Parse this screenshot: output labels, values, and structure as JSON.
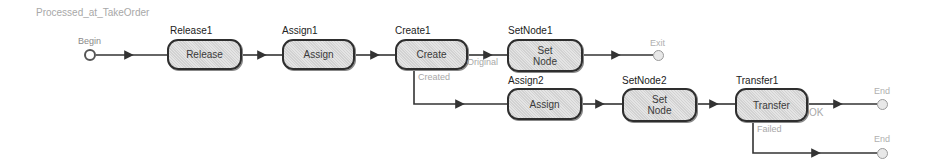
{
  "diagram": {
    "title": "Processed_at_TakeOrder",
    "begin": {
      "label": "Begin"
    },
    "nodes": [
      {
        "id": "release1",
        "name": "Release1",
        "text": "Release"
      },
      {
        "id": "assign1",
        "name": "Assign1",
        "text": "Assign"
      },
      {
        "id": "create1",
        "name": "Create1",
        "text": "Create"
      },
      {
        "id": "setnode1",
        "name": "SetNode1",
        "text": "Set\nNode"
      },
      {
        "id": "assign2",
        "name": "Assign2",
        "text": "Assign"
      },
      {
        "id": "setnode2",
        "name": "SetNode2",
        "text": "Set\nNode"
      },
      {
        "id": "transfer1",
        "name": "Transfer1",
        "text": "Transfer"
      }
    ],
    "terminals": [
      {
        "id": "exit",
        "label": "Exit"
      },
      {
        "id": "end1",
        "label": "End"
      },
      {
        "id": "end2",
        "label": "End"
      }
    ],
    "edge_labels": {
      "create_original": "Original",
      "create_created": "Created",
      "transfer_ok": "OK",
      "transfer_failed": "Failed"
    },
    "colors": {
      "wire": "#333333",
      "node_border": "#2e2e2e",
      "node_fill": "#dcdcdc",
      "muted_text": "#a8a8a8"
    }
  }
}
